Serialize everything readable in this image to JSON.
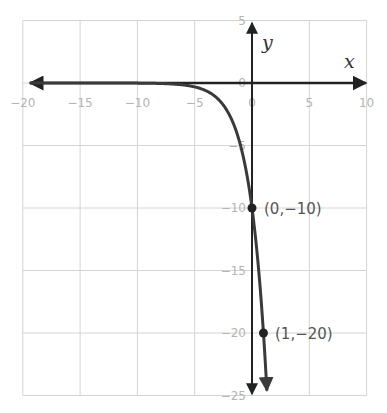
{
  "chart_data": {
    "type": "line",
    "title": "",
    "function": "y = -10·2^x",
    "xlabel": "x",
    "ylabel": "y",
    "xlim": [
      -20,
      10
    ],
    "ylim": [
      -25,
      5
    ],
    "grid": true,
    "x_ticks": [
      -20,
      -15,
      -10,
      -5,
      0,
      5,
      10
    ],
    "x_tick_labels": [
      "−20",
      "−15",
      "−10",
      "−5",
      "0",
      "5",
      "10"
    ],
    "y_ticks": [
      5,
      0,
      -5,
      -10,
      -15,
      -20,
      -25
    ],
    "y_tick_labels": [
      "5",
      "0",
      "−5",
      "−10",
      "−15",
      "−20",
      "−25"
    ],
    "series": [
      {
        "name": "y = -10·2^x",
        "x": [
          -20,
          -10,
          -5,
          -4,
          -3,
          -2,
          -1,
          0,
          1,
          1.32
        ],
        "values": [
          -1e-05,
          -0.0098,
          -0.3125,
          -0.625,
          -1.25,
          -2.5,
          -5,
          -10,
          -20,
          -25
        ],
        "color": "#3a3a3a"
      }
    ],
    "points": [
      {
        "x": 0,
        "y": -10,
        "label": "(0, −10)"
      },
      {
        "x": 1,
        "y": -20,
        "label": "(1, −20)"
      }
    ],
    "annotations": [
      "(0,−10)",
      "(1,−20)"
    ]
  },
  "labels": {
    "x_axis": "x",
    "y_axis": "y",
    "point_a": "(0,−10)",
    "point_b": "(1,−20)"
  },
  "colors": {
    "grid": "#d4d4d4",
    "axis": "#222222",
    "curve": "#3a3a3a",
    "tick_text": "#b4b4b4",
    "point_text": "#555555"
  }
}
